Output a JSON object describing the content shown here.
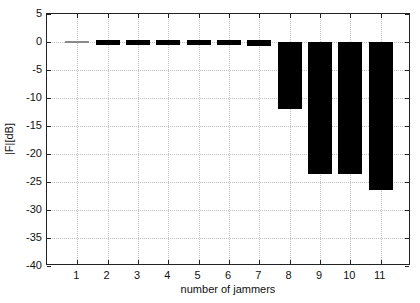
{
  "figure": {
    "background": "#ffffff",
    "axis_color": "#222222",
    "grid_color": "#c2c2c2",
    "bar_color": "#000000",
    "near_zero_bar_color": "#8a8a8a"
  },
  "chart_data": {
    "type": "bar",
    "title": "",
    "xlabel": "number of jammers",
    "ylabel": "|F|[dB]",
    "categories": [
      1,
      2,
      3,
      4,
      5,
      6,
      7,
      8,
      9,
      10,
      11
    ],
    "values": [
      -0.05,
      -0.3,
      -0.35,
      -0.4,
      -0.45,
      -0.5,
      -0.7,
      -12,
      -23.5,
      -23.5,
      -26.4
    ],
    "xlim": [
      0,
      12
    ],
    "ylim": [
      -40,
      5
    ],
    "xticks": [
      1,
      2,
      3,
      4,
      5,
      6,
      7,
      8,
      9,
      10,
      11
    ],
    "yticks": [
      5,
      0,
      -5,
      -10,
      -15,
      -20,
      -25,
      -30,
      -35,
      -40
    ],
    "grid": true,
    "legend": null,
    "bar_width_fraction": 0.8
  }
}
